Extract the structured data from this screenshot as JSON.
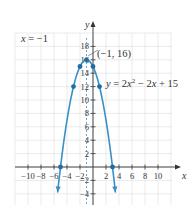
{
  "chart_data": {
    "type": "line",
    "title": "",
    "xlabel": "x",
    "ylabel": "y",
    "xlim": [
      -12,
      12
    ],
    "ylim": [
      -6,
      20
    ],
    "grid": true,
    "x_ticks": [
      -10,
      -8,
      -6,
      -4,
      -2,
      2,
      4,
      6,
      8,
      10
    ],
    "x_tick_labels": [
      "−10",
      "−8",
      "−6",
      "−4",
      "−2",
      "2",
      "4",
      "6",
      "8",
      "10"
    ],
    "y_ticks": [
      -4,
      -2,
      2,
      4,
      6,
      8,
      10,
      12,
      14,
      16,
      18
    ],
    "y_tick_labels": [
      "−4",
      "−2",
      "2",
      "4",
      "6",
      "8",
      "10",
      "12",
      "14",
      "16",
      "18"
    ],
    "series": [
      {
        "name": "y = 2x² − 2x + 15",
        "function": "-x^2 - 2x + 15",
        "color": "#3a8fc7",
        "x_range": [
          -5.45,
          3.45
        ],
        "points": [
          {
            "x": -5,
            "y": 0
          },
          {
            "x": -3,
            "y": 12
          },
          {
            "x": -2,
            "y": 15
          },
          {
            "x": -1,
            "y": 16
          },
          {
            "x": 0,
            "y": 15
          },
          {
            "x": 1,
            "y": 12
          },
          {
            "x": 3,
            "y": 0
          }
        ]
      }
    ],
    "annotations": [
      {
        "text": "x = −1",
        "type": "axis-of-symmetry",
        "x": -1
      },
      {
        "text": "(−1, 16)",
        "type": "vertex-label",
        "at": {
          "x": -1,
          "y": 16
        }
      },
      {
        "text": "y = 2x² − 2x + 15",
        "type": "equation-label"
      }
    ]
  },
  "labels": {
    "axis_symmetry": "x = −1",
    "vertex": "(−1, 16)",
    "equation_prefix": "y = 2x",
    "equation_exp": "2",
    "equation_suffix": " − 2x + 15",
    "x_axis": "x",
    "y_axis": "y"
  },
  "colors": {
    "curve": "#3a8fc7",
    "point": "#1f6ea3",
    "grid": "#e3e3e3",
    "axis": "#333333",
    "text": "#333333"
  }
}
